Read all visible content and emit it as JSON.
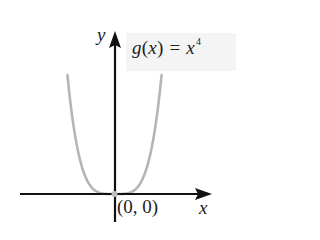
{
  "chart_data": {
    "type": "line",
    "title": "",
    "function_label": {
      "name": "g",
      "variable": "x",
      "equals": "=",
      "base": "x",
      "exponent": "4"
    },
    "expression": "g(x) = x^4",
    "xlabel": "x",
    "ylabel": "y",
    "xlim": [
      -1.3,
      1.3
    ],
    "ylim": [
      0,
      2.86
    ],
    "grid": false,
    "legend": null,
    "ticks": {
      "x": [],
      "y": []
    },
    "annotations": [
      {
        "text": "(0, 0)",
        "x": 0,
        "y": 0,
        "marker": "point"
      }
    ],
    "series": [
      {
        "name": "g(x) = x^4",
        "color": "#b5b5b5",
        "x": [
          -1.3,
          -1.2,
          -1.1,
          -1.0,
          -0.9,
          -0.8,
          -0.7,
          -0.6,
          -0.5,
          -0.4,
          -0.3,
          -0.2,
          -0.1,
          0,
          0.1,
          0.2,
          0.3,
          0.4,
          0.5,
          0.6,
          0.7,
          0.8,
          0.9,
          1.0,
          1.1,
          1.2,
          1.3
        ],
        "y": [
          2.8561,
          2.0736,
          1.4641,
          1.0,
          0.6561,
          0.4096,
          0.2401,
          0.1296,
          0.0625,
          0.0256,
          0.0081,
          0.0016,
          0.0001,
          0,
          0.0001,
          0.0016,
          0.0081,
          0.0256,
          0.0625,
          0.1296,
          0.2401,
          0.4096,
          0.6561,
          1.0,
          1.4641,
          2.0736,
          2.8561
        ]
      }
    ]
  },
  "labels": {
    "y_axis": "y",
    "x_axis": "x",
    "origin": "(0, 0)",
    "func_name": "g",
    "func_open": "(",
    "func_var": "x",
    "func_close": ")",
    "func_eq": "=",
    "func_base": "x",
    "func_exp": "4"
  },
  "colors": {
    "axis": "#111111",
    "curve": "#b5b5b5",
    "origin_point": "#bdbdbd",
    "label_bg": "#f4f4f4",
    "text": "#222222"
  }
}
